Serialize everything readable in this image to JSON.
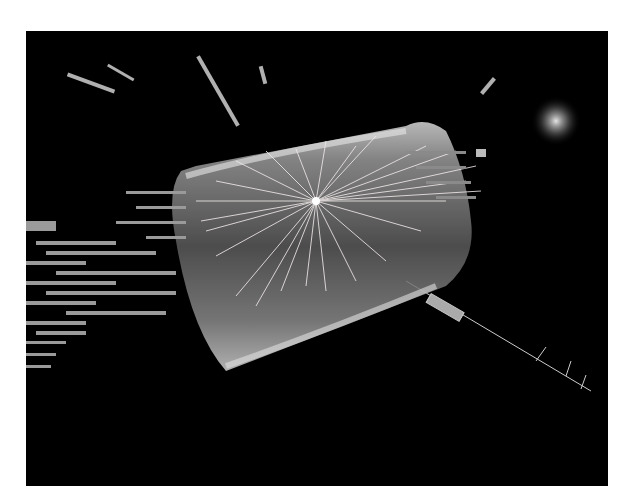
{
  "image": {
    "alt": "Black-and-white rendering of a particle collision event: a translucent cylindrical detector with many particle tracks radiating from a central vertex, calorimeter hits as bars on the left, and a bright cluster in the upper right",
    "background_color": "#000000",
    "frame_color": "#ffffff",
    "elements": {
      "detector_cylinder": "translucent grey barrel",
      "collision_vertex": "bright central point with radiating tracks",
      "calorimeter_hits": "grey bars spreading to the left",
      "energy_cluster": "bright speckled cluster upper right",
      "muon_track": "thin line extending to lower right with tick marks"
    }
  }
}
